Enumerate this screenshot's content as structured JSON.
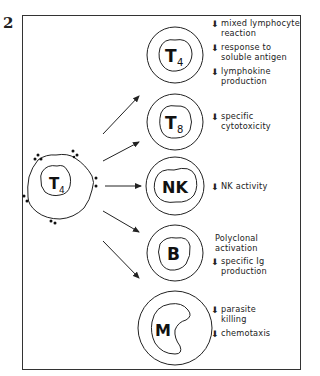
{
  "figure": {
    "number": "2",
    "source_cell": {
      "label": "T",
      "subscript": "4"
    },
    "target_cells": [
      {
        "id": "t4",
        "label": "T",
        "subscript": "4",
        "effects": [
          {
            "direction": "down",
            "text": "mixed lymphocyte\nreaction"
          },
          {
            "direction": "down",
            "text": "response to\nsoluble antigen"
          },
          {
            "direction": "down",
            "text": "lymphokine\nproduction"
          }
        ]
      },
      {
        "id": "t8",
        "label": "T",
        "subscript": "8",
        "effects": [
          {
            "direction": "down",
            "text": "specific\ncytotoxicity"
          }
        ]
      },
      {
        "id": "nk",
        "label": "NK",
        "subscript": "",
        "effects": [
          {
            "direction": "down",
            "text": "NK activity"
          }
        ]
      },
      {
        "id": "b",
        "label": "B",
        "subscript": "",
        "effects": [
          {
            "direction": "none",
            "text": "Polyclonal\nactivation"
          },
          {
            "direction": "down",
            "text": "specific Ig\nproduction"
          }
        ]
      },
      {
        "id": "m",
        "label": "M",
        "subscript": "",
        "effects": [
          {
            "direction": "down",
            "text": "parasite\nkilling"
          },
          {
            "direction": "down",
            "text": "chemotaxis"
          }
        ]
      }
    ],
    "arrow_glyph": "⬇"
  }
}
